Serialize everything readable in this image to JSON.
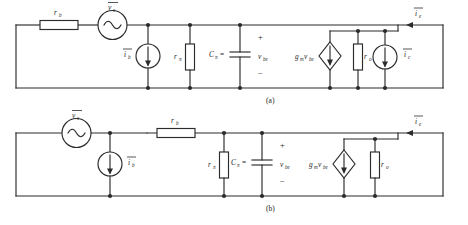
{
  "figure": {
    "background_color": "#ffffff",
    "line_color": "#2b2b2b",
    "text_color": "#1d1d1d"
  },
  "captions": {
    "a": "(a)",
    "b": "(b)"
  },
  "symbols": {
    "r_b": {
      "base": "r",
      "sub": "b"
    },
    "r_pi": {
      "base": "r",
      "sub": "π"
    },
    "r_o": {
      "base": "r",
      "sub": "o"
    },
    "C_pi": {
      "base": "C",
      "sub": "π"
    },
    "v_s": {
      "base": "v",
      "sub": "s",
      "overline": true
    },
    "v_be": {
      "base": "v",
      "sub": "be"
    },
    "i_b": {
      "base": "i",
      "sub": "b",
      "overline": true
    },
    "i_c": {
      "base": "i",
      "sub": "c",
      "overline": true
    },
    "i_e": {
      "base": "i",
      "sub": "e",
      "overline": true
    },
    "gm_vbe": {
      "base": "g",
      "sub": "m",
      "second": "v",
      "second_sub": "be"
    },
    "plus": "+",
    "minus": "−",
    "equals": "="
  },
  "circuit_a": {
    "id": "circuit-a",
    "caption": "(a)",
    "components": [
      {
        "name": "resistor-rb",
        "type": "resistor",
        "label": "r",
        "sublabel": "b"
      },
      {
        "name": "source-vs",
        "type": "ac-voltage-source",
        "label": "v",
        "sublabel": "s",
        "overline": true
      },
      {
        "name": "source-ib",
        "type": "current-source",
        "label": "i",
        "sublabel": "b",
        "overline": true
      },
      {
        "name": "resistor-rpi",
        "type": "resistor",
        "label": "r",
        "sublabel": "π"
      },
      {
        "name": "capacitor-cpi",
        "type": "capacitor",
        "label": "C",
        "sublabel": "π"
      },
      {
        "name": "voltage-vbe",
        "type": "node-voltage",
        "label": "v",
        "sublabel": "be"
      },
      {
        "name": "source-gmvbe",
        "type": "dependent-current-source",
        "label": "g",
        "sublabel": "m",
        "label2": "v",
        "sublabel2": "be"
      },
      {
        "name": "resistor-ro",
        "type": "resistor",
        "label": "r",
        "sublabel": "o"
      },
      {
        "name": "source-ic",
        "type": "current-source",
        "label": "i",
        "sublabel": "c",
        "overline": true
      },
      {
        "name": "current-ie",
        "type": "current-arrow",
        "label": "i",
        "sublabel": "e",
        "overline": true
      }
    ]
  },
  "circuit_b": {
    "id": "circuit-b",
    "caption": "(b)",
    "components": [
      {
        "name": "source-vs",
        "type": "ac-voltage-source",
        "label": "v",
        "sublabel": "s",
        "overline": true
      },
      {
        "name": "source-ib",
        "type": "current-source",
        "label": "i",
        "sublabel": "b",
        "overline": true
      },
      {
        "name": "resistor-rb",
        "type": "resistor",
        "label": "r",
        "sublabel": "b"
      },
      {
        "name": "resistor-rpi",
        "type": "resistor",
        "label": "r",
        "sublabel": "π"
      },
      {
        "name": "capacitor-cpi",
        "type": "capacitor",
        "label": "C",
        "sublabel": "π"
      },
      {
        "name": "voltage-vbe",
        "type": "node-voltage",
        "label": "v",
        "sublabel": "be"
      },
      {
        "name": "source-gmvbe",
        "type": "dependent-current-source",
        "label": "g",
        "sublabel": "m",
        "label2": "v",
        "sublabel2": "be"
      },
      {
        "name": "resistor-ro",
        "type": "resistor",
        "label": "r",
        "sublabel": "o"
      },
      {
        "name": "current-ie",
        "type": "current-arrow",
        "label": "i",
        "sublabel": "e",
        "overline": true
      }
    ]
  }
}
